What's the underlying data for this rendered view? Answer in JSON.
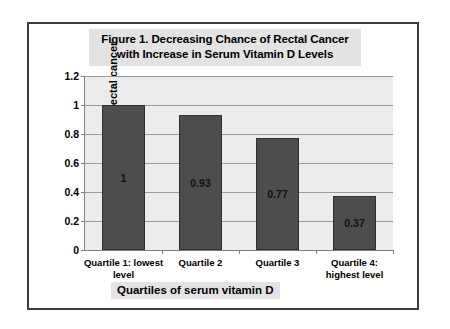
{
  "figure": {
    "title_line1": "Figure 1.  Decreasing Chance of Rectal Cancer",
    "title_line2": "with Increase in Serum Vitamin D Levels"
  },
  "chart_data": {
    "type": "bar",
    "title": "Figure 1.  Decreasing Chance of Rectal Cancer with Increase in Serum Vitamin D Levels",
    "xlabel": "Quartiles of serum vitamin D",
    "ylabel": "% risk of rectal cancer",
    "categories": [
      "Quartile 1: lowest level",
      "Quartile 2",
      "Quartile 3",
      "Quartile 4: highest level"
    ],
    "category_lines": [
      [
        "Quartile 1: lowest",
        "level"
      ],
      [
        "Quartile 2"
      ],
      [
        "Quartile 3"
      ],
      [
        "Quartile 4:",
        "highest level"
      ]
    ],
    "values": [
      1,
      0.93,
      0.77,
      0.37
    ],
    "value_labels": [
      "1",
      "0.93",
      "0.77",
      "0.37"
    ],
    "ylim": [
      0,
      1.2
    ],
    "yticks": [
      0,
      0.2,
      0.4,
      0.6,
      0.8,
      1,
      1.2
    ],
    "ytick_labels": [
      "0",
      "0.2",
      "0.4",
      "0.6",
      "0.8",
      "1",
      "1.2"
    ],
    "grid": true,
    "legend": false,
    "bar_color": "#4d4d4d",
    "plot_background": "#ececec",
    "gridline_color": "#9a9a9a"
  }
}
